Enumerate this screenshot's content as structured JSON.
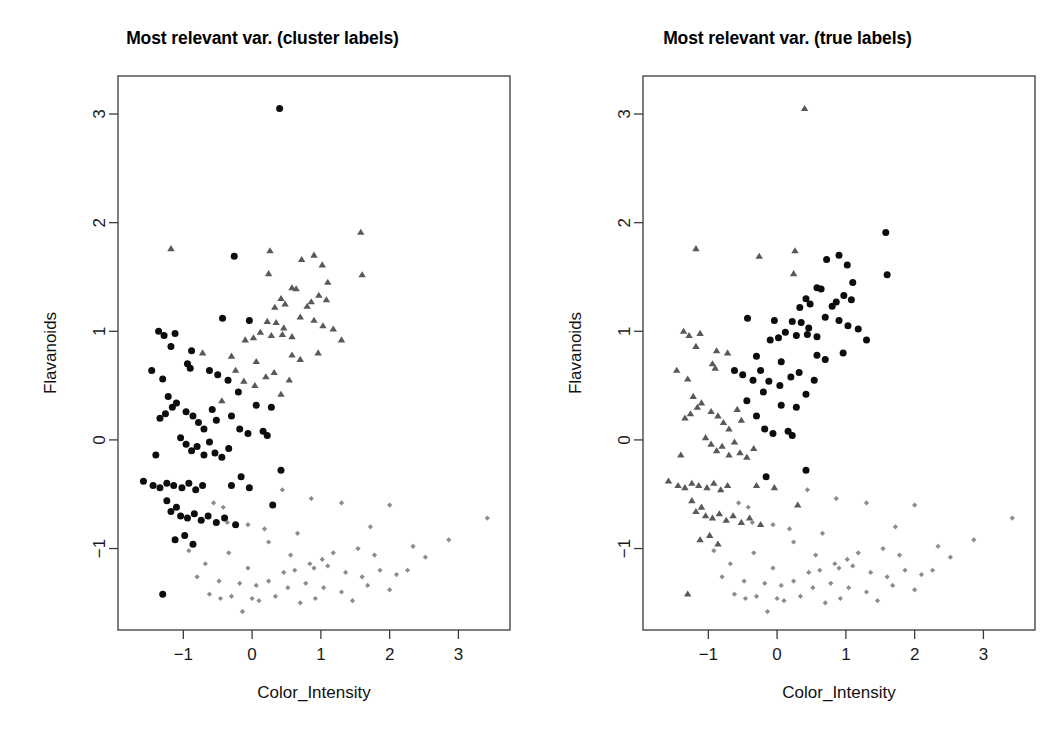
{
  "figure": {
    "width": 1050,
    "height": 738,
    "background": "#ffffff"
  },
  "panels": [
    {
      "id": "cluster-labels",
      "title": "Most relevant var. (cluster labels)",
      "label_kind": "cluster"
    },
    {
      "id": "true-labels",
      "title": "Most relevant var. (true labels)",
      "label_kind": "true"
    }
  ],
  "chart_data": {
    "type": "scatter",
    "xlabel": "Color_Intensity",
    "ylabel": "Flavanoids",
    "xlim": [
      -1.95,
      3.75
    ],
    "ylim": [
      -1.75,
      3.35
    ],
    "xticks": [
      -1,
      0,
      1,
      2,
      3
    ],
    "yticks": [
      -1,
      0,
      1,
      2,
      3
    ],
    "xticklabels": [
      "-1",
      "0",
      "1",
      "2",
      "3"
    ],
    "yticklabels": [
      "-1",
      "0",
      "1",
      "2",
      "3"
    ],
    "grid": false,
    "legend": "none",
    "marker_styles": {
      "group1": {
        "shape": "circle",
        "color": "#0d0d0d",
        "size": 5.2
      },
      "group2": {
        "shape": "triangle",
        "color": "#595959",
        "size": 6.0
      },
      "group3": {
        "shape": "diamond",
        "color": "#8c8c8c",
        "size": 4.2
      }
    },
    "points": [
      {
        "x": 0.4,
        "y": 3.05,
        "cluster": 1,
        "true": 2
      },
      {
        "x": 1.58,
        "y": 1.91,
        "cluster": 2,
        "true": 1
      },
      {
        "x": -0.26,
        "y": 1.69,
        "cluster": 1,
        "true": 2
      },
      {
        "x": 0.26,
        "y": 1.74,
        "cluster": 2,
        "true": 2
      },
      {
        "x": 0.9,
        "y": 1.7,
        "cluster": 2,
        "true": 1
      },
      {
        "x": 0.72,
        "y": 1.66,
        "cluster": 2,
        "true": 1
      },
      {
        "x": 1.02,
        "y": 1.61,
        "cluster": 2,
        "true": 1
      },
      {
        "x": 0.24,
        "y": 1.53,
        "cluster": 2,
        "true": 2
      },
      {
        "x": 1.1,
        "y": 1.45,
        "cluster": 2,
        "true": 1
      },
      {
        "x": 1.6,
        "y": 1.52,
        "cluster": 2,
        "true": 1
      },
      {
        "x": -1.18,
        "y": 1.76,
        "cluster": 2,
        "true": 2
      },
      {
        "x": 0.58,
        "y": 1.4,
        "cluster": 2,
        "true": 1
      },
      {
        "x": 0.64,
        "y": 1.39,
        "cluster": 2,
        "true": 1
      },
      {
        "x": 0.97,
        "y": 1.33,
        "cluster": 2,
        "true": 1
      },
      {
        "x": 1.08,
        "y": 1.29,
        "cluster": 2,
        "true": 1
      },
      {
        "x": 0.42,
        "y": 1.3,
        "cluster": 2,
        "true": 1
      },
      {
        "x": 0.48,
        "y": 1.25,
        "cluster": 2,
        "true": 1
      },
      {
        "x": 0.33,
        "y": 1.22,
        "cluster": 2,
        "true": 1
      },
      {
        "x": 0.8,
        "y": 1.23,
        "cluster": 2,
        "true": 1
      },
      {
        "x": 0.86,
        "y": 1.27,
        "cluster": 2,
        "true": 1
      },
      {
        "x": 0.7,
        "y": 1.13,
        "cluster": 2,
        "true": 1
      },
      {
        "x": 0.9,
        "y": 1.1,
        "cluster": 2,
        "true": 1
      },
      {
        "x": 1.03,
        "y": 1.05,
        "cluster": 2,
        "true": 1
      },
      {
        "x": 1.18,
        "y": 1.02,
        "cluster": 2,
        "true": 1
      },
      {
        "x": -0.43,
        "y": 1.12,
        "cluster": 1,
        "true": 1
      },
      {
        "x": -0.04,
        "y": 1.1,
        "cluster": 1,
        "true": 1
      },
      {
        "x": 0.22,
        "y": 1.09,
        "cluster": 2,
        "true": 1
      },
      {
        "x": 0.35,
        "y": 1.08,
        "cluster": 2,
        "true": 1
      },
      {
        "x": 0.46,
        "y": 1.03,
        "cluster": 2,
        "true": 1
      },
      {
        "x": 0.12,
        "y": 0.99,
        "cluster": 2,
        "true": 1
      },
      {
        "x": 0.28,
        "y": 0.96,
        "cluster": 2,
        "true": 1
      },
      {
        "x": 0.44,
        "y": 0.97,
        "cluster": 2,
        "true": 1
      },
      {
        "x": 0.58,
        "y": 0.95,
        "cluster": 2,
        "true": 1
      },
      {
        "x": 0.02,
        "y": 0.94,
        "cluster": 2,
        "true": 1
      },
      {
        "x": -0.1,
        "y": 0.92,
        "cluster": 2,
        "true": 1
      },
      {
        "x": -1.28,
        "y": 0.96,
        "cluster": 1,
        "true": 2
      },
      {
        "x": -1.12,
        "y": 0.98,
        "cluster": 1,
        "true": 2
      },
      {
        "x": -1.18,
        "y": 0.86,
        "cluster": 1,
        "true": 2
      },
      {
        "x": -0.88,
        "y": 0.82,
        "cluster": 1,
        "true": 2
      },
      {
        "x": -0.72,
        "y": 0.8,
        "cluster": 2,
        "true": 2
      },
      {
        "x": -0.94,
        "y": 0.7,
        "cluster": 1,
        "true": 2
      },
      {
        "x": -0.9,
        "y": 0.66,
        "cluster": 1,
        "true": 2
      },
      {
        "x": -0.3,
        "y": 0.77,
        "cluster": 2,
        "true": 1
      },
      {
        "x": -0.24,
        "y": 0.64,
        "cluster": 2,
        "true": 1
      },
      {
        "x": 0.06,
        "y": 0.72,
        "cluster": 2,
        "true": 1
      },
      {
        "x": 0.58,
        "y": 0.78,
        "cluster": 2,
        "true": 1
      },
      {
        "x": 0.7,
        "y": 0.74,
        "cluster": 2,
        "true": 1
      },
      {
        "x": 0.96,
        "y": 0.8,
        "cluster": 2,
        "true": 1
      },
      {
        "x": 0.32,
        "y": 0.62,
        "cluster": 2,
        "true": 1
      },
      {
        "x": 0.2,
        "y": 0.58,
        "cluster": 2,
        "true": 1
      },
      {
        "x": -0.12,
        "y": 0.54,
        "cluster": 2,
        "true": 1
      },
      {
        "x": 0.04,
        "y": 0.5,
        "cluster": 2,
        "true": 1
      },
      {
        "x": -0.35,
        "y": 0.55,
        "cluster": 1,
        "true": 1
      },
      {
        "x": -0.5,
        "y": 0.6,
        "cluster": 1,
        "true": 1
      },
      {
        "x": -0.62,
        "y": 0.64,
        "cluster": 1,
        "true": 1
      },
      {
        "x": -1.3,
        "y": 0.56,
        "cluster": 1,
        "true": 2
      },
      {
        "x": -1.22,
        "y": 0.4,
        "cluster": 1,
        "true": 2
      },
      {
        "x": -1.1,
        "y": 0.34,
        "cluster": 1,
        "true": 2
      },
      {
        "x": -1.16,
        "y": 0.3,
        "cluster": 1,
        "true": 2
      },
      {
        "x": -1.26,
        "y": 0.24,
        "cluster": 1,
        "true": 2
      },
      {
        "x": -1.34,
        "y": 0.2,
        "cluster": 1,
        "true": 2
      },
      {
        "x": -0.96,
        "y": 0.26,
        "cluster": 1,
        "true": 2
      },
      {
        "x": -0.86,
        "y": 0.22,
        "cluster": 1,
        "true": 2
      },
      {
        "x": -0.78,
        "y": 0.16,
        "cluster": 1,
        "true": 2
      },
      {
        "x": -0.7,
        "y": 0.1,
        "cluster": 1,
        "true": 2
      },
      {
        "x": -0.58,
        "y": 0.28,
        "cluster": 1,
        "true": 2
      },
      {
        "x": -0.52,
        "y": 0.18,
        "cluster": 1,
        "true": 2
      },
      {
        "x": -0.44,
        "y": 0.36,
        "cluster": 2,
        "true": 1
      },
      {
        "x": -0.3,
        "y": 0.22,
        "cluster": 1,
        "true": 1
      },
      {
        "x": -0.18,
        "y": 0.1,
        "cluster": 1,
        "true": 1
      },
      {
        "x": -0.06,
        "y": 0.06,
        "cluster": 1,
        "true": 1
      },
      {
        "x": 0.16,
        "y": 0.08,
        "cluster": 1,
        "true": 1
      },
      {
        "x": 0.22,
        "y": 0.04,
        "cluster": 1,
        "true": 1
      },
      {
        "x": -1.04,
        "y": 0.02,
        "cluster": 1,
        "true": 2
      },
      {
        "x": -0.96,
        "y": -0.04,
        "cluster": 1,
        "true": 2
      },
      {
        "x": -0.88,
        "y": -0.1,
        "cluster": 1,
        "true": 2
      },
      {
        "x": -0.8,
        "y": -0.06,
        "cluster": 1,
        "true": 2
      },
      {
        "x": -0.7,
        "y": -0.14,
        "cluster": 1,
        "true": 2
      },
      {
        "x": -0.62,
        "y": -0.02,
        "cluster": 1,
        "true": 2
      },
      {
        "x": -0.54,
        "y": -0.12,
        "cluster": 1,
        "true": 2
      },
      {
        "x": -0.44,
        "y": -0.16,
        "cluster": 1,
        "true": 2
      },
      {
        "x": -0.34,
        "y": -0.08,
        "cluster": 1,
        "true": 2
      },
      {
        "x": -1.4,
        "y": -0.14,
        "cluster": 1,
        "true": 2
      },
      {
        "x": -1.58,
        "y": -0.38,
        "cluster": 1,
        "true": 2
      },
      {
        "x": -1.44,
        "y": -0.42,
        "cluster": 1,
        "true": 2
      },
      {
        "x": -1.34,
        "y": -0.44,
        "cluster": 1,
        "true": 2
      },
      {
        "x": -1.24,
        "y": -0.4,
        "cluster": 1,
        "true": 2
      },
      {
        "x": -1.14,
        "y": -0.42,
        "cluster": 1,
        "true": 2
      },
      {
        "x": -1.02,
        "y": -0.44,
        "cluster": 1,
        "true": 2
      },
      {
        "x": -0.92,
        "y": -0.4,
        "cluster": 1,
        "true": 2
      },
      {
        "x": -0.82,
        "y": -0.46,
        "cluster": 1,
        "true": 2
      },
      {
        "x": -0.72,
        "y": -0.42,
        "cluster": 1,
        "true": 2
      },
      {
        "x": -0.3,
        "y": -0.42,
        "cluster": 1,
        "true": 2
      },
      {
        "x": -0.04,
        "y": -0.44,
        "cluster": 1,
        "true": 2
      },
      {
        "x": 0.3,
        "y": -0.6,
        "cluster": 1,
        "true": 2
      },
      {
        "x": -1.24,
        "y": -0.56,
        "cluster": 1,
        "true": 2
      },
      {
        "x": -1.1,
        "y": -0.62,
        "cluster": 1,
        "true": 2
      },
      {
        "x": -1.18,
        "y": -0.66,
        "cluster": 1,
        "true": 2
      },
      {
        "x": -1.04,
        "y": -0.7,
        "cluster": 1,
        "true": 2
      },
      {
        "x": -0.94,
        "y": -0.72,
        "cluster": 1,
        "true": 2
      },
      {
        "x": -0.84,
        "y": -0.68,
        "cluster": 1,
        "true": 2
      },
      {
        "x": -0.74,
        "y": -0.74,
        "cluster": 1,
        "true": 2
      },
      {
        "x": -0.64,
        "y": -0.7,
        "cluster": 1,
        "true": 2
      },
      {
        "x": -0.52,
        "y": -0.76,
        "cluster": 1,
        "true": 2
      },
      {
        "x": -0.4,
        "y": -0.72,
        "cluster": 1,
        "true": 2
      },
      {
        "x": -0.24,
        "y": -0.78,
        "cluster": 1,
        "true": 2
      },
      {
        "x": -1.12,
        "y": -0.92,
        "cluster": 1,
        "true": 2
      },
      {
        "x": -0.98,
        "y": -0.88,
        "cluster": 1,
        "true": 2
      },
      {
        "x": -0.86,
        "y": -0.96,
        "cluster": 1,
        "true": 2
      },
      {
        "x": -1.3,
        "y": -1.42,
        "cluster": 1,
        "true": 2
      },
      {
        "x": -0.56,
        "y": -0.58,
        "cluster": 3,
        "true": 3
      },
      {
        "x": -0.42,
        "y": -0.62,
        "cluster": 3,
        "true": 3
      },
      {
        "x": -0.36,
        "y": -0.76,
        "cluster": 3,
        "true": 3
      },
      {
        "x": 0.44,
        "y": -0.46,
        "cluster": 3,
        "true": 3
      },
      {
        "x": 0.86,
        "y": -0.54,
        "cluster": 3,
        "true": 3
      },
      {
        "x": 1.3,
        "y": -0.58,
        "cluster": 3,
        "true": 3
      },
      {
        "x": 2.0,
        "y": -0.6,
        "cluster": 3,
        "true": 3
      },
      {
        "x": 3.42,
        "y": -0.72,
        "cluster": 3,
        "true": 3
      },
      {
        "x": 1.72,
        "y": -0.8,
        "cluster": 3,
        "true": 3
      },
      {
        "x": 2.86,
        "y": -0.92,
        "cluster": 3,
        "true": 3
      },
      {
        "x": -0.06,
        "y": -0.78,
        "cluster": 3,
        "true": 3
      },
      {
        "x": 0.18,
        "y": -0.82,
        "cluster": 3,
        "true": 3
      },
      {
        "x": 0.66,
        "y": -0.86,
        "cluster": 3,
        "true": 3
      },
      {
        "x": 0.24,
        "y": -0.94,
        "cluster": 3,
        "true": 3
      },
      {
        "x": -0.92,
        "y": -1.02,
        "cluster": 3,
        "true": 3
      },
      {
        "x": -0.34,
        "y": -1.04,
        "cluster": 3,
        "true": 3
      },
      {
        "x": 0.56,
        "y": -1.06,
        "cluster": 3,
        "true": 3
      },
      {
        "x": 0.84,
        "y": -1.14,
        "cluster": 3,
        "true": 3
      },
      {
        "x": 1.02,
        "y": -1.1,
        "cluster": 3,
        "true": 3
      },
      {
        "x": 1.18,
        "y": -1.04,
        "cluster": 3,
        "true": 3
      },
      {
        "x": 1.54,
        "y": -1.0,
        "cluster": 3,
        "true": 3
      },
      {
        "x": 1.78,
        "y": -1.06,
        "cluster": 3,
        "true": 3
      },
      {
        "x": 2.34,
        "y": -0.98,
        "cluster": 3,
        "true": 3
      },
      {
        "x": 2.52,
        "y": -1.08,
        "cluster": 3,
        "true": 3
      },
      {
        "x": -0.06,
        "y": -1.18,
        "cluster": 3,
        "true": 3
      },
      {
        "x": 0.46,
        "y": -1.22,
        "cluster": 3,
        "true": 3
      },
      {
        "x": 0.62,
        "y": -1.2,
        "cluster": 3,
        "true": 3
      },
      {
        "x": 0.9,
        "y": -1.18,
        "cluster": 3,
        "true": 3
      },
      {
        "x": 1.1,
        "y": -1.16,
        "cluster": 3,
        "true": 3
      },
      {
        "x": 1.36,
        "y": -1.22,
        "cluster": 3,
        "true": 3
      },
      {
        "x": 1.6,
        "y": -1.26,
        "cluster": 3,
        "true": 3
      },
      {
        "x": 1.86,
        "y": -1.2,
        "cluster": 3,
        "true": 3
      },
      {
        "x": 2.1,
        "y": -1.24,
        "cluster": 3,
        "true": 3
      },
      {
        "x": 2.26,
        "y": -1.2,
        "cluster": 3,
        "true": 3
      },
      {
        "x": -0.48,
        "y": -1.3,
        "cluster": 3,
        "true": 3
      },
      {
        "x": -0.18,
        "y": -1.32,
        "cluster": 3,
        "true": 3
      },
      {
        "x": 0.06,
        "y": -1.34,
        "cluster": 3,
        "true": 3
      },
      {
        "x": 0.24,
        "y": -1.3,
        "cluster": 3,
        "true": 3
      },
      {
        "x": 0.52,
        "y": -1.36,
        "cluster": 3,
        "true": 3
      },
      {
        "x": 0.78,
        "y": -1.32,
        "cluster": 3,
        "true": 3
      },
      {
        "x": 1.04,
        "y": -1.36,
        "cluster": 3,
        "true": 3
      },
      {
        "x": 1.3,
        "y": -1.4,
        "cluster": 3,
        "true": 3
      },
      {
        "x": 1.68,
        "y": -1.34,
        "cluster": 3,
        "true": 3
      },
      {
        "x": 2.0,
        "y": -1.38,
        "cluster": 3,
        "true": 3
      },
      {
        "x": -0.62,
        "y": -1.42,
        "cluster": 3,
        "true": 3
      },
      {
        "x": -0.46,
        "y": -1.46,
        "cluster": 3,
        "true": 3
      },
      {
        "x": -0.3,
        "y": -1.44,
        "cluster": 3,
        "true": 3
      },
      {
        "x": 0.0,
        "y": -1.46,
        "cluster": 3,
        "true": 3
      },
      {
        "x": 0.1,
        "y": -1.48,
        "cluster": 3,
        "true": 3
      },
      {
        "x": 0.34,
        "y": -1.44,
        "cluster": 3,
        "true": 3
      },
      {
        "x": 0.7,
        "y": -1.5,
        "cluster": 3,
        "true": 3
      },
      {
        "x": -0.14,
        "y": -1.58,
        "cluster": 3,
        "true": 3
      },
      {
        "x": 0.92,
        "y": -1.46,
        "cluster": 3,
        "true": 3
      },
      {
        "x": 1.46,
        "y": -1.48,
        "cluster": 3,
        "true": 3
      },
      {
        "x": -0.8,
        "y": -1.26,
        "cluster": 3,
        "true": 3
      },
      {
        "x": -0.68,
        "y": -1.14,
        "cluster": 3,
        "true": 3
      },
      {
        "x": -1.36,
        "y": 1.0,
        "cluster": 1,
        "true": 2
      },
      {
        "x": 0.42,
        "y": -0.28,
        "cluster": 1,
        "true": 1
      },
      {
        "x": -0.16,
        "y": -0.34,
        "cluster": 1,
        "true": 1
      },
      {
        "x": 0.28,
        "y": 0.3,
        "cluster": 1,
        "true": 1
      },
      {
        "x": 0.06,
        "y": 0.32,
        "cluster": 1,
        "true": 1
      },
      {
        "x": -0.2,
        "y": 0.44,
        "cluster": 1,
        "true": 1
      },
      {
        "x": 0.42,
        "y": 0.42,
        "cluster": 2,
        "true": 1
      },
      {
        "x": 0.54,
        "y": 0.55,
        "cluster": 2,
        "true": 1
      },
      {
        "x": -1.46,
        "y": 0.64,
        "cluster": 1,
        "true": 2
      },
      {
        "x": 1.3,
        "y": 0.92,
        "cluster": 2,
        "true": 1
      }
    ]
  }
}
